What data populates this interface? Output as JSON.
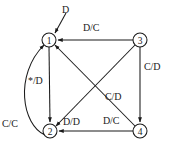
{
  "diagram": {
    "type": "finite-state-machine",
    "title": "",
    "background_color": "#ffffff",
    "stroke_color": "#1a1a1a",
    "nodes": [
      {
        "id": "1",
        "label": "1",
        "cx": 49,
        "cy": 40,
        "r": 7
      },
      {
        "id": "2",
        "label": "2",
        "cx": 50,
        "cy": 131,
        "r": 7
      },
      {
        "id": "3",
        "label": "3",
        "cx": 140,
        "cy": 40,
        "r": 7
      },
      {
        "id": "4",
        "label": "4",
        "cx": 140,
        "cy": 131,
        "r": 7
      }
    ],
    "start": {
      "target": "1",
      "label": "D",
      "label_x": 62,
      "label_y": 7
    },
    "edges": [
      {
        "id": "e-3-1",
        "from": "3",
        "to": "1",
        "label": "D/C",
        "label_x": 83,
        "label_y": 24,
        "shape": "straight"
      },
      {
        "id": "e-3-4",
        "from": "3",
        "to": "4",
        "label": "C/D",
        "label_x": 143,
        "label_y": 62,
        "shape": "straight"
      },
      {
        "id": "e-3-2",
        "from": "3",
        "to": "2",
        "label": "",
        "label_x": 0,
        "label_y": 0,
        "shape": "diagonal"
      },
      {
        "id": "e-2-3",
        "from": "2",
        "to": "1",
        "label": "C/C",
        "label_x": 3,
        "label_y": 119,
        "shape": "curve"
      },
      {
        "id": "e-4-1",
        "from": "4",
        "to": "1",
        "label": "C/D",
        "label_x": 105,
        "label_y": 92,
        "shape": "diagonal"
      },
      {
        "id": "e-4-2",
        "from": "4",
        "to": "2",
        "label": "D/C",
        "label_x": 104,
        "label_y": 117,
        "shape": "straight"
      },
      {
        "id": "e-1-2",
        "from": "1",
        "to": "2",
        "label": "*/D",
        "label_x": 28,
        "label_y": 76,
        "shape": "straight"
      },
      {
        "id": "e-d-d",
        "from": "2",
        "to": "2",
        "label": "D/D",
        "label_x": 63,
        "label_y": 117,
        "shape": "label-only"
      }
    ],
    "labels": [
      {
        "name": "start-label",
        "text": "D"
      },
      {
        "name": "edge-label-d-c-top",
        "text": "D/C"
      },
      {
        "name": "edge-label-c-d-right",
        "text": "C/D"
      },
      {
        "name": "edge-label-c-d-center",
        "text": "C/D"
      },
      {
        "name": "edge-label-star-d",
        "text": "*/D"
      },
      {
        "name": "edge-label-c-c",
        "text": "C/C"
      },
      {
        "name": "edge-label-d-d",
        "text": "D/D"
      },
      {
        "name": "edge-label-d-c-bottom",
        "text": "D/C"
      }
    ]
  }
}
